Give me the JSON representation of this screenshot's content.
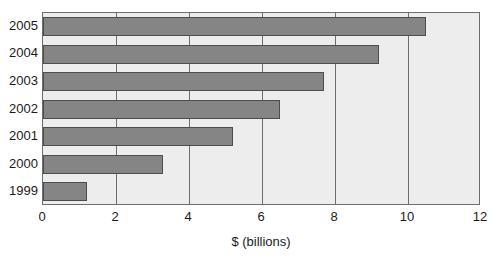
{
  "chart_data": {
    "type": "bar",
    "orientation": "horizontal",
    "title": "",
    "subtitle": "",
    "xlabel": "$ (billions)",
    "ylabel": "",
    "categories": [
      "1999",
      "2000",
      "2001",
      "2002",
      "2003",
      "2004",
      "2005"
    ],
    "values": [
      1.2,
      3.3,
      5.2,
      6.5,
      7.7,
      9.2,
      10.5
    ],
    "series": [
      {
        "name": "",
        "values": [
          1.2,
          3.3,
          5.2,
          6.5,
          7.7,
          9.2,
          10.5
        ]
      }
    ],
    "xlim": [
      0,
      12
    ],
    "xticks": [
      "0",
      "2",
      "4",
      "6",
      "8",
      "10",
      "12"
    ],
    "xtick_values": [
      0,
      2,
      4,
      6,
      8,
      10,
      12
    ],
    "grid": "vertical",
    "legend": "none",
    "bar_order_top_to_bottom": [
      "2005",
      "2004",
      "2003",
      "2002",
      "2001",
      "2000",
      "1999"
    ],
    "colors": {
      "bar_fill": "#858585",
      "bar_border": "#4d4d4d",
      "plot_background": "#ededed",
      "axis": "#6d6d6d",
      "text": "#1a1a1a",
      "page_background": "#ffffff"
    }
  }
}
